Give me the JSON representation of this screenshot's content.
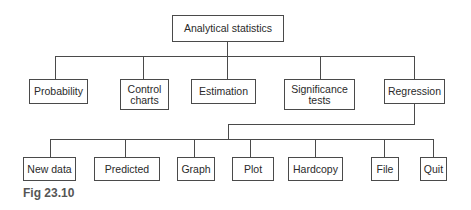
{
  "diagram": {
    "root": {
      "label": "Analytical statistics"
    },
    "level1": [
      {
        "label": "Probability"
      },
      {
        "label": "Control\ncharts"
      },
      {
        "label": "Estimation"
      },
      {
        "label": "Significance\ntests"
      },
      {
        "label": "Regression"
      }
    ],
    "regression_children": [
      {
        "label": "New data"
      },
      {
        "label": "Predicted"
      },
      {
        "label": "Graph"
      },
      {
        "label": "Plot"
      },
      {
        "label": "Hardcopy"
      },
      {
        "label": "File"
      },
      {
        "label": "Quit"
      }
    ],
    "caption": "Fig 23.10"
  }
}
